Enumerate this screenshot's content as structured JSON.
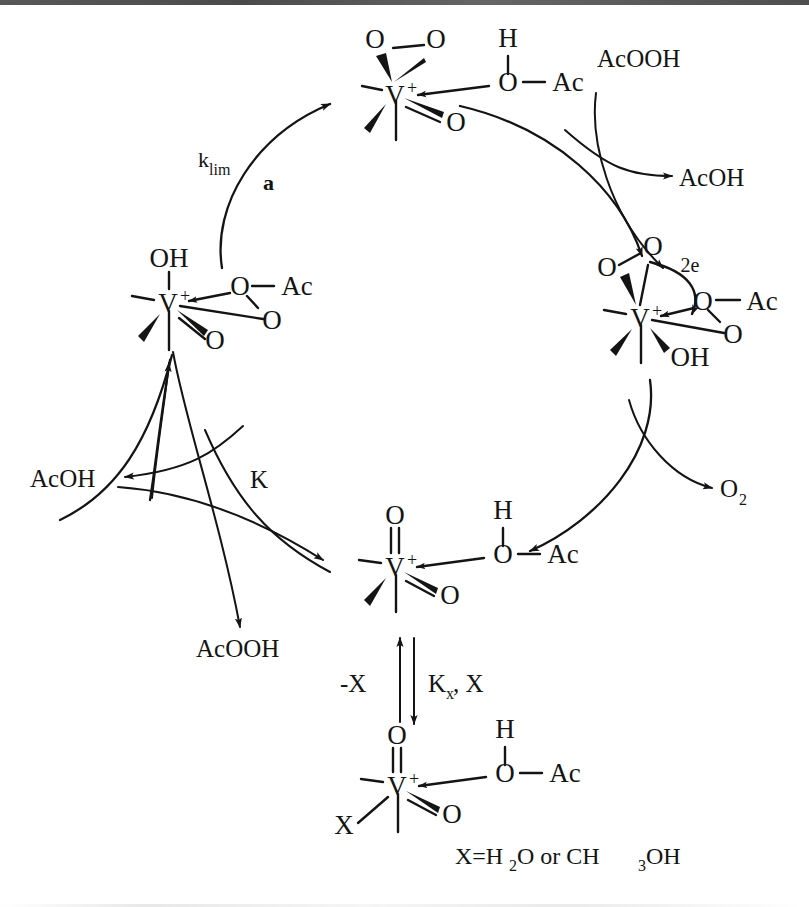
{
  "scheme": {
    "title": "Catalytic cycle for vanadium-catalysed peracid oxidation",
    "caption": "X=H2O or CH3OH",
    "caption_parts": {
      "prefix": "X=H",
      "sub1": "2",
      "mid": "O or CH",
      "sub2": "3",
      "suffix": "OH"
    }
  },
  "rate_labels": {
    "k_lim": {
      "base": "k",
      "sub": "lim"
    },
    "branch_a": "a",
    "equilibrium_K": "K",
    "Kx": {
      "base": "K",
      "sub": "x",
      "rest": ", X"
    },
    "minus_X": "-X",
    "two_electron": "2e"
  },
  "reagents": {
    "acooh_in": "AcOOH",
    "acoh_out_right": "AcOH",
    "dioxygen": {
      "base": "O",
      "sub": "2"
    },
    "acoh_out_left": "AcOH",
    "acooh_out_left": "AcOOH"
  },
  "complexes": [
    {
      "id": "top-peroxo",
      "position": "top",
      "center_label": "V",
      "charge": "+",
      "ligands": [
        {
          "name": "peroxo-left-O",
          "text": "O"
        },
        {
          "name": "peroxo-right-O",
          "text": "O"
        },
        {
          "name": "oxo-O",
          "text": "O"
        },
        {
          "name": "acetate-H",
          "text": "H"
        },
        {
          "name": "acetate-O",
          "text": "O"
        },
        {
          "name": "acetate-Ac",
          "text": "Ac"
        }
      ]
    },
    {
      "id": "right-peroxo-hydroxo",
      "position": "right",
      "center_label": "V",
      "charge": "+",
      "ligands": [
        {
          "name": "peroxo-upper-O",
          "text": "O"
        },
        {
          "name": "peroxo-left-O",
          "text": "O"
        },
        {
          "name": "hydroxo-OH",
          "text": "OH"
        },
        {
          "name": "acetate-O",
          "text": "O"
        },
        {
          "name": "acetate-Ac",
          "text": "Ac"
        },
        {
          "name": "carbonyl-O",
          "text": "O"
        }
      ]
    },
    {
      "id": "left-hydroxo-peracetate",
      "position": "left",
      "center_label": "V",
      "charge": "+",
      "ligands": [
        {
          "name": "hydroxo-OH",
          "text": "OH"
        },
        {
          "name": "peracetate-O",
          "text": "O"
        },
        {
          "name": "peracetate-Ac",
          "text": "Ac"
        },
        {
          "name": "peracetate-O2",
          "text": "O"
        },
        {
          "name": "oxo-O",
          "text": "O"
        }
      ]
    },
    {
      "id": "bottom-dioxo",
      "position": "bottom-center",
      "center_label": "V",
      "charge": "+",
      "ligands": [
        {
          "name": "oxo-top-O",
          "text": "O"
        },
        {
          "name": "oxo-O",
          "text": "O"
        },
        {
          "name": "acetic-H",
          "text": "H"
        },
        {
          "name": "acetic-O",
          "text": "O"
        },
        {
          "name": "acetic-Ac",
          "text": "Ac"
        }
      ]
    },
    {
      "id": "bottom-X-adduct",
      "position": "bottom",
      "center_label": "V",
      "charge": "+",
      "ligands": [
        {
          "name": "oxo-top-O",
          "text": "O"
        },
        {
          "name": "oxo-O",
          "text": "O"
        },
        {
          "name": "X-ligand",
          "text": "X"
        },
        {
          "name": "acetic-H",
          "text": "H"
        },
        {
          "name": "acetic-O",
          "text": "O"
        },
        {
          "name": "acetic-Ac",
          "text": "Ac"
        }
      ]
    }
  ]
}
